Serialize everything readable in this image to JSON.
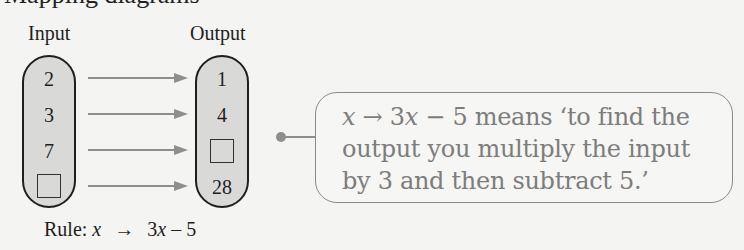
{
  "heading": {
    "clipped_text": "Mapping diagrams"
  },
  "diagram": {
    "input_label": "Input",
    "output_label": "Output",
    "inputs": [
      "2",
      "3",
      "7",
      "□"
    ],
    "outputs": [
      "1",
      "4",
      "□",
      "28"
    ],
    "rule": {
      "prefix": "Rule:",
      "variable": "x",
      "arrow": "→",
      "expression_coef": "3",
      "expression_var": "x",
      "expression_rest": " – 5"
    }
  },
  "callout": {
    "var": "x",
    "arrow": " → ",
    "coef": "3",
    "var2": "x",
    "rest_line1": " − 5 means ‘to find the",
    "line2": "output you multiply the input",
    "line3": "by 3 and then subtract 5.’"
  },
  "colors": {
    "capsule_fill": "#d9d9d7",
    "arrow": "#8e8e8e",
    "callout_text": "#7d7d7d",
    "callout_border": "#8a8a8a"
  }
}
